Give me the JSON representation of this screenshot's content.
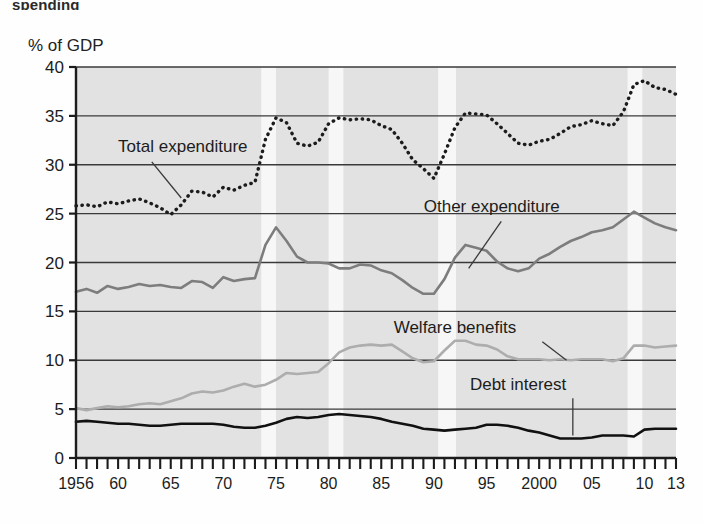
{
  "figure": {
    "title_partial": "spending",
    "y_axis_unit_label": "% of GDP"
  },
  "chart_data": {
    "type": "line",
    "title": "% of GDP",
    "xlabel": "",
    "ylabel": "% of GDP",
    "ylim": [
      0,
      40
    ],
    "ytick_labels": [
      "0",
      "5",
      "10",
      "15",
      "20",
      "25",
      "30",
      "35",
      "40"
    ],
    "yticks": [
      0,
      5,
      10,
      15,
      20,
      25,
      30,
      35,
      40
    ],
    "xlim": [
      1956,
      2013
    ],
    "xtick_labels": [
      "1956",
      "60",
      "65",
      "70",
      "75",
      "80",
      "85",
      "90",
      "95",
      "2000",
      "05",
      "10",
      "13"
    ],
    "xticks": [
      1956,
      1960,
      1965,
      1970,
      1975,
      1980,
      1985,
      1990,
      1995,
      2000,
      2005,
      2010,
      2013
    ],
    "minor_tick_interval": 1,
    "grid": "horizontal",
    "plot_background": "#e2e2e2",
    "band_color": "#f7f7f7",
    "legend_position": "inline-annotations",
    "shaded_bands": [
      {
        "start": 1973.6,
        "end": 1975.0
      },
      {
        "start": 1980.0,
        "end": 1981.4
      },
      {
        "start": 1990.4,
        "end": 1992.1
      },
      {
        "start": 2008.4,
        "end": 2009.8
      }
    ],
    "series": [
      {
        "name": "Total expenditure",
        "color": "#1c1c1c",
        "style": "dotted",
        "label_x": 1960.0,
        "label_y": 31.3,
        "x": [
          1956,
          1957,
          1958,
          1959,
          1960,
          1961,
          1962,
          1963,
          1964,
          1965,
          1966,
          1967,
          1968,
          1969,
          1970,
          1971,
          1972,
          1973,
          1974,
          1975,
          1976,
          1977,
          1978,
          1979,
          1980,
          1981,
          1982,
          1983,
          1984,
          1985,
          1986,
          1987,
          1988,
          1989,
          1990,
          1991,
          1992,
          1993,
          1994,
          1995,
          1996,
          1997,
          1998,
          1999,
          2000,
          2001,
          2002,
          2003,
          2004,
          2005,
          2006,
          2007,
          2008,
          2009,
          2010,
          2011,
          2012,
          2013
        ],
        "values": [
          25.8,
          25.9,
          25.7,
          26.2,
          26.0,
          26.3,
          26.5,
          26.1,
          25.6,
          24.9,
          25.9,
          27.3,
          27.2,
          26.7,
          27.7,
          27.4,
          27.9,
          28.2,
          32.6,
          34.8,
          34.3,
          32.2,
          31.9,
          32.3,
          34.2,
          34.8,
          34.6,
          34.7,
          34.6,
          34.0,
          33.6,
          32.2,
          30.5,
          29.6,
          28.6,
          31.1,
          33.8,
          35.3,
          35.2,
          35.1,
          34.2,
          33.2,
          32.2,
          32.0,
          32.4,
          32.6,
          33.2,
          33.9,
          34.1,
          34.5,
          34.2,
          34.0,
          35.4,
          38.2,
          38.6,
          37.9,
          37.7,
          37.2
        ]
      },
      {
        "name": "Other expenditure",
        "color": "#7d7d7d",
        "style": "solid",
        "label_x": 1995.5,
        "label_y": 25.2,
        "x": [
          1956,
          1957,
          1958,
          1959,
          1960,
          1961,
          1962,
          1963,
          1964,
          1965,
          1966,
          1967,
          1968,
          1969,
          1970,
          1971,
          1972,
          1973,
          1974,
          1975,
          1976,
          1977,
          1978,
          1979,
          1980,
          1981,
          1982,
          1983,
          1984,
          1985,
          1986,
          1987,
          1988,
          1989,
          1990,
          1991,
          1992,
          1993,
          1994,
          1995,
          1996,
          1997,
          1998,
          1999,
          2000,
          2001,
          2002,
          2003,
          2004,
          2005,
          2006,
          2007,
          2008,
          2009,
          2010,
          2011,
          2012,
          2013
        ],
        "values": [
          17.0,
          17.3,
          16.9,
          17.6,
          17.3,
          17.5,
          17.8,
          17.6,
          17.7,
          17.5,
          17.4,
          18.1,
          18.0,
          17.4,
          18.5,
          18.1,
          18.3,
          18.4,
          21.8,
          23.6,
          22.2,
          20.6,
          20.0,
          20.0,
          19.9,
          19.4,
          19.4,
          19.8,
          19.7,
          19.2,
          18.9,
          18.2,
          17.4,
          16.8,
          16.8,
          18.3,
          20.5,
          21.8,
          21.5,
          21.2,
          20.1,
          19.4,
          19.1,
          19.4,
          20.4,
          20.9,
          21.6,
          22.2,
          22.6,
          23.1,
          23.3,
          23.6,
          24.4,
          25.2,
          24.6,
          24.0,
          23.6,
          23.3
        ]
      },
      {
        "name": "Welfare benefits",
        "color": "#adadad",
        "style": "solid",
        "label_x": 1992.0,
        "label_y": 12.8,
        "x": [
          1956,
          1957,
          1958,
          1959,
          1960,
          1961,
          1962,
          1963,
          1964,
          1965,
          1966,
          1967,
          1968,
          1969,
          1970,
          1971,
          1972,
          1973,
          1974,
          1975,
          1976,
          1977,
          1978,
          1979,
          1980,
          1981,
          1982,
          1983,
          1984,
          1985,
          1986,
          1987,
          1988,
          1989,
          1990,
          1991,
          1992,
          1993,
          1994,
          1995,
          1996,
          1997,
          1998,
          1999,
          2000,
          2001,
          2002,
          2003,
          2004,
          2005,
          2006,
          2007,
          2008,
          2009,
          2010,
          2011,
          2012,
          2013
        ],
        "values": [
          5.1,
          4.9,
          5.1,
          5.3,
          5.2,
          5.3,
          5.5,
          5.6,
          5.5,
          5.8,
          6.1,
          6.6,
          6.8,
          6.7,
          6.9,
          7.3,
          7.6,
          7.3,
          7.5,
          8.0,
          8.7,
          8.6,
          8.7,
          8.8,
          9.7,
          10.8,
          11.3,
          11.5,
          11.6,
          11.5,
          11.6,
          10.9,
          10.2,
          9.8,
          9.9,
          11.0,
          12.0,
          12.0,
          11.6,
          11.5,
          11.1,
          10.4,
          10.1,
          10.1,
          10.1,
          10.0,
          10.1,
          10.0,
          10.1,
          10.1,
          10.1,
          9.9,
          10.2,
          11.5,
          11.5,
          11.3,
          11.4,
          11.5
        ]
      },
      {
        "name": "Debt interest",
        "color": "#111111",
        "style": "solid",
        "label_x": 1998.0,
        "label_y": 7.0,
        "x": [
          1956,
          1957,
          1958,
          1959,
          1960,
          1961,
          1962,
          1963,
          1964,
          1965,
          1966,
          1967,
          1968,
          1969,
          1970,
          1971,
          1972,
          1973,
          1974,
          1975,
          1976,
          1977,
          1978,
          1979,
          1980,
          1981,
          1982,
          1983,
          1984,
          1985,
          1986,
          1987,
          1988,
          1989,
          1990,
          1991,
          1992,
          1993,
          1994,
          1995,
          1996,
          1997,
          1998,
          1999,
          2000,
          2001,
          2002,
          2003,
          2004,
          2005,
          2006,
          2007,
          2008,
          2009,
          2010,
          2011,
          2012,
          2013
        ],
        "values": [
          3.7,
          3.8,
          3.7,
          3.6,
          3.5,
          3.5,
          3.4,
          3.3,
          3.3,
          3.4,
          3.5,
          3.5,
          3.5,
          3.5,
          3.4,
          3.2,
          3.1,
          3.1,
          3.3,
          3.6,
          4.0,
          4.2,
          4.1,
          4.2,
          4.4,
          4.5,
          4.4,
          4.3,
          4.2,
          4.0,
          3.7,
          3.5,
          3.3,
          3.0,
          2.9,
          2.8,
          2.9,
          3.0,
          3.1,
          3.4,
          3.4,
          3.3,
          3.1,
          2.8,
          2.6,
          2.3,
          2.0,
          2.0,
          2.0,
          2.1,
          2.3,
          2.3,
          2.3,
          2.2,
          2.9,
          3.0,
          3.0,
          3.0
        ]
      }
    ]
  }
}
